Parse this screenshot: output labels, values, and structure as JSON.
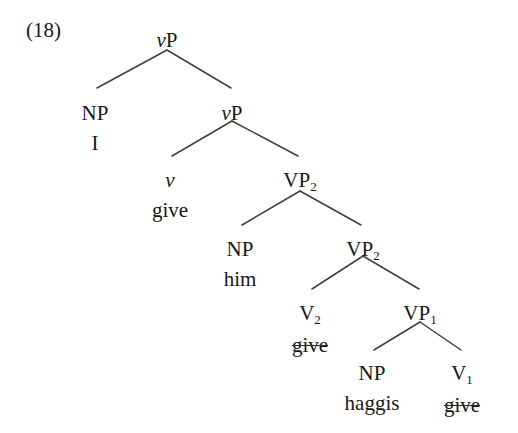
{
  "figure": {
    "example_number": "(18)",
    "sentence": "I give him haggis",
    "line_color": "#3f3f3f",
    "text_color": "#171717",
    "background_color": "#ffffff"
  },
  "tree": {
    "nodes": [
      {
        "id": "vp-root",
        "category": "vP",
        "category_head": "v",
        "category_tail": "P",
        "italic_head": true,
        "subscript": "",
        "word": "",
        "word_struck": false,
        "x": 167,
        "y": 30
      },
      {
        "id": "np-subj",
        "category": "NP",
        "category_head": "NP",
        "category_tail": "",
        "italic_head": false,
        "subscript": "",
        "word": "I",
        "word_struck": false,
        "x": 95,
        "y": 103
      },
      {
        "id": "vp-inner",
        "category": "vP",
        "category_head": "v",
        "category_tail": "P",
        "italic_head": true,
        "subscript": "",
        "word": "",
        "word_struck": false,
        "x": 232,
        "y": 103
      },
      {
        "id": "v-light",
        "category": "v",
        "category_head": "v",
        "category_tail": "",
        "italic_head": true,
        "subscript": "",
        "word": "give",
        "word_struck": false,
        "x": 170,
        "y": 170
      },
      {
        "id": "vp2-upper",
        "category": "VP2",
        "category_head": "VP",
        "category_tail": "",
        "italic_head": false,
        "subscript": "2",
        "word": "",
        "word_struck": false,
        "x": 300,
        "y": 170
      },
      {
        "id": "np-iobj",
        "category": "NP",
        "category_head": "NP",
        "category_tail": "",
        "italic_head": false,
        "subscript": "",
        "word": "him",
        "word_struck": false,
        "x": 240,
        "y": 239
      },
      {
        "id": "vp2-lower",
        "category": "VP2",
        "category_head": "VP",
        "category_tail": "",
        "italic_head": false,
        "subscript": "2",
        "word": "",
        "word_struck": false,
        "x": 363,
        "y": 239
      },
      {
        "id": "v2",
        "category": "V2",
        "category_head": "V",
        "category_tail": "",
        "italic_head": false,
        "subscript": "2",
        "word": "give",
        "word_struck": true,
        "x": 310,
        "y": 303
      },
      {
        "id": "vp1",
        "category": "VP1",
        "category_head": "VP",
        "category_tail": "",
        "italic_head": false,
        "subscript": "1",
        "word": "",
        "word_struck": false,
        "x": 420,
        "y": 303
      },
      {
        "id": "np-dobj",
        "category": "NP",
        "category_head": "NP",
        "category_tail": "",
        "italic_head": false,
        "subscript": "",
        "word": "haggis",
        "word_struck": false,
        "x": 372,
        "y": 363
      },
      {
        "id": "v1",
        "category": "V1",
        "category_head": "V",
        "category_tail": "",
        "italic_head": false,
        "subscript": "1",
        "word": "give",
        "word_struck": true,
        "x": 462,
        "y": 363
      }
    ],
    "branches": [
      {
        "name": "branch-vp-root-to-np-subj",
        "x1": 167,
        "y1": 50,
        "x2": 97,
        "y2": 88
      },
      {
        "name": "branch-vp-root-to-vp-inner",
        "x1": 167,
        "y1": 50,
        "x2": 231,
        "y2": 88
      },
      {
        "name": "branch-vp-inner-to-v-light",
        "x1": 232,
        "y1": 121,
        "x2": 172,
        "y2": 156
      },
      {
        "name": "branch-vp-inner-to-vp2-upper",
        "x1": 232,
        "y1": 121,
        "x2": 298,
        "y2": 156
      },
      {
        "name": "branch-vp2-upper-to-np-iobj",
        "x1": 300,
        "y1": 191,
        "x2": 242,
        "y2": 225
      },
      {
        "name": "branch-vp2-upper-to-vp2-lower",
        "x1": 300,
        "y1": 191,
        "x2": 361,
        "y2": 225
      },
      {
        "name": "branch-vp2-lower-to-v2",
        "x1": 363,
        "y1": 256,
        "x2": 312,
        "y2": 289
      },
      {
        "name": "branch-vp2-lower-to-vp1",
        "x1": 363,
        "y1": 256,
        "x2": 419,
        "y2": 289
      },
      {
        "name": "branch-vp1-to-np-dobj",
        "x1": 420,
        "y1": 322,
        "x2": 374,
        "y2": 350
      },
      {
        "name": "branch-vp1-to-v1",
        "x1": 420,
        "y1": 322,
        "x2": 461,
        "y2": 350
      }
    ]
  }
}
